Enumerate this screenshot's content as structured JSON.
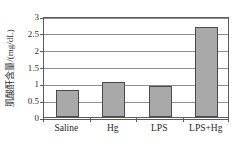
{
  "chart_data": {
    "type": "bar",
    "title": "",
    "xlabel": "",
    "ylabel": "肌酸酐含量/(mg/dL)",
    "categories": [
      "Saline",
      "Hg",
      "LPS",
      "LPS+Hg"
    ],
    "values": [
      0.81,
      1.03,
      0.93,
      2.68
    ],
    "ylim": [
      0,
      3
    ],
    "ytick_labels": [
      "0",
      "0.5",
      "1",
      "1.5",
      "2",
      "2.5",
      "3"
    ],
    "ytick_values": [
      0,
      0.5,
      1,
      1.5,
      2,
      2.5,
      3
    ],
    "grid": true,
    "legend": null,
    "bar_fill_color": "#a9a9a9",
    "bar_edge_color": "#4a4a4a",
    "grid_color": "#8e8e8e",
    "axis_color": "#5b5b5b",
    "background_color": "#ffffff"
  }
}
